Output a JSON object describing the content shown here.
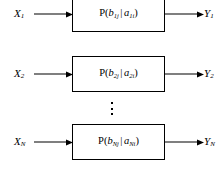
{
  "diagram": {
    "type": "block-diagram",
    "line_color": "#000000",
    "background_color": "#ffffff",
    "ellipsis_glyph": "vertical-ellipsis",
    "channels": [
      {
        "input_label": "X",
        "input_subscript": "1",
        "box_prefix": "P(",
        "box_b": "b",
        "box_b_subscript": "1j",
        "box_bar": "|",
        "box_a": "a",
        "box_a_subscript": "1i",
        "box_suffix": ")",
        "output_label": "Y",
        "output_subscript": "1"
      },
      {
        "input_label": "X",
        "input_subscript": "2",
        "box_prefix": "P(",
        "box_b": "b",
        "box_b_subscript": "2j",
        "box_bar": "|",
        "box_a": "a",
        "box_a_subscript": "2i",
        "box_suffix": ")",
        "output_label": "Y",
        "output_subscript": "2"
      },
      {
        "input_label": "X",
        "input_subscript": "N",
        "box_prefix": "P(",
        "box_b": "b",
        "box_b_subscript": "Nj",
        "box_bar": "|",
        "box_a": "a",
        "box_a_subscript": "Ni",
        "box_suffix": ")",
        "output_label": "Y",
        "output_subscript": "N"
      }
    ]
  }
}
